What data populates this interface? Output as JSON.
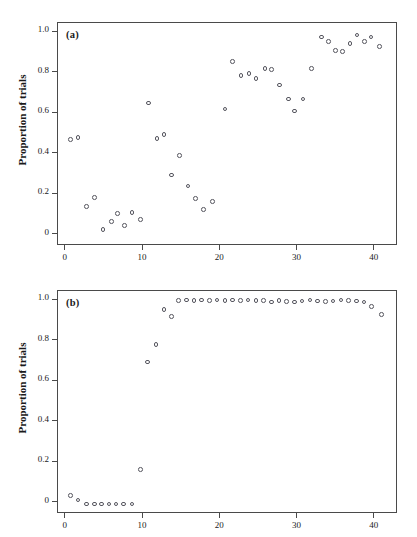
{
  "figure": {
    "background": "#ffffff",
    "marker_color": "#55555e",
    "axis_color": "#4a4a4a"
  },
  "panels": [
    {
      "id": "a",
      "label": "(a)",
      "ylabel": "Proportion of trials"
    },
    {
      "id": "b",
      "label": "(b)",
      "ylabel": "Proportion of trials"
    }
  ],
  "axes": {
    "x_ticks": [
      "0",
      "10",
      "20",
      "30",
      "40"
    ],
    "x_tick_values": [
      0,
      10,
      20,
      30,
      40
    ],
    "y_ticks": [
      "0",
      "0.2",
      "0.4",
      "0.6",
      "0.8",
      "1.0"
    ],
    "y_tick_values": [
      0,
      0.2,
      0.4,
      0.6,
      0.8,
      1.0
    ],
    "xlim": [
      -1.0,
      43.0
    ],
    "ylim": [
      -0.055,
      1.045
    ]
  },
  "chart_data": [
    {
      "type": "scatter",
      "panel": "(a)",
      "title": "",
      "xlabel": "",
      "ylabel": "Proportion of trials",
      "xlim": [
        -1.0,
        43.0
      ],
      "ylim": [
        -0.055,
        1.045
      ],
      "xticks": [
        0,
        10,
        20,
        30,
        40
      ],
      "yticks": [
        0,
        0.2,
        0.4,
        0.6,
        0.8,
        1.0
      ],
      "grid": false,
      "legend": null,
      "marker": "open-circle",
      "x": [
        0.6,
        1.6,
        2.7,
        3.7,
        4.8,
        5.9,
        6.7,
        7.6,
        8.6,
        9.7,
        10.7,
        11.8,
        12.7,
        13.7,
        14.7,
        15.8,
        16.8,
        17.8,
        19.0,
        20.6,
        21.6,
        22.7,
        23.7,
        24.6,
        25.8,
        26.6,
        27.7,
        28.8,
        29.6,
        30.7,
        31.8,
        33.1,
        34.0,
        34.9,
        35.8,
        36.8,
        37.7,
        38.7,
        39.5,
        40.6
      ],
      "y": [
        0.47,
        0.48,
        0.14,
        0.185,
        0.025,
        0.065,
        0.105,
        0.045,
        0.11,
        0.075,
        0.65,
        0.475,
        0.495,
        0.295,
        0.39,
        0.24,
        0.18,
        0.125,
        0.165,
        0.62,
        0.855,
        0.785,
        0.795,
        0.77,
        0.82,
        0.815,
        0.74,
        0.67,
        0.61,
        0.67,
        0.82,
        0.975,
        0.955,
        0.91,
        0.905,
        0.945,
        0.985,
        0.955,
        0.975,
        0.93
      ]
    },
    {
      "type": "scatter",
      "panel": "(b)",
      "title": "",
      "xlabel": "",
      "ylabel": "Proportion of trials",
      "xlim": [
        -1.0,
        43.0
      ],
      "ylim": [
        -0.055,
        1.045
      ],
      "xticks": [
        0,
        10,
        20,
        30,
        40
      ],
      "yticks": [
        0,
        0.2,
        0.4,
        0.6,
        0.8,
        1.0
      ],
      "grid": false,
      "legend": null,
      "marker": "open-circle",
      "x": [
        0.6,
        1.6,
        2.7,
        3.7,
        4.6,
        5.6,
        6.5,
        7.5,
        8.6,
        9.7,
        10.6,
        11.7,
        12.7,
        13.7,
        14.6,
        15.6,
        16.6,
        17.6,
        18.6,
        19.6,
        20.6,
        21.6,
        22.6,
        23.6,
        24.6,
        25.6,
        26.6,
        27.6,
        28.6,
        29.6,
        30.6,
        31.6,
        32.6,
        33.6,
        34.6,
        35.6,
        36.6,
        37.6,
        38.6,
        39.6,
        40.9
      ],
      "y": [
        0.035,
        0.015,
        -0.005,
        -0.005,
        -0.005,
        -0.005,
        -0.005,
        -0.005,
        -0.005,
        0.165,
        0.695,
        0.78,
        0.955,
        0.92,
        0.998,
        1.0,
        0.998,
        1.0,
        0.998,
        1.0,
        0.998,
        1.0,
        0.998,
        1.0,
        0.998,
        0.998,
        0.99,
        0.998,
        0.992,
        0.99,
        0.995,
        1.0,
        0.995,
        0.992,
        0.995,
        1.0,
        0.998,
        0.995,
        0.99,
        0.968,
        0.93
      ]
    }
  ]
}
